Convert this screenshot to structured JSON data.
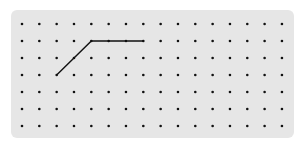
{
  "grid": {
    "columns": 16,
    "rows": 7,
    "origin_x": 22,
    "origin_y": 24,
    "spacing_x": 17.33,
    "spacing_y": 17,
    "dot_color": "#111111",
    "background_color": "#e6e6e6"
  },
  "polyline": {
    "color": "#111111",
    "points_grid": [
      [
        2,
        3
      ],
      [
        4,
        1
      ],
      [
        7,
        1
      ]
    ]
  }
}
